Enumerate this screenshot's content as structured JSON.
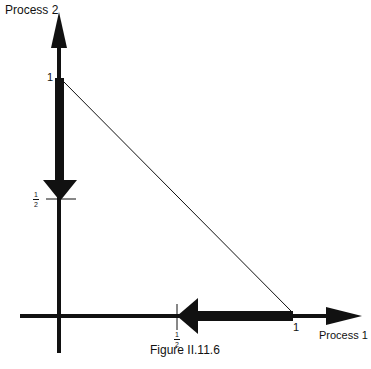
{
  "diagram": {
    "y_axis_label": "Process 2",
    "x_axis_label": "Process 1",
    "y_tick_one": "1",
    "x_tick_one": "1",
    "y_tick_half": {
      "num": "1",
      "den": "2"
    },
    "x_tick_half": {
      "num": "1",
      "den": "2"
    },
    "caption": "Figure II.11.6",
    "colors": {
      "ink": "#111111",
      "background": "#ffffff"
    },
    "elements": [
      "Vertical axis arrow (Process 2) pointing up",
      "Horizontal axis arrow (Process 1) pointing right",
      "Thin diagonal line from (0,1) to (1,0)",
      "Thick arrow along Process 2 axis from 1 down to 1/2",
      "Thick arrow along Process 1 axis from 1 left to 1/2"
    ]
  }
}
